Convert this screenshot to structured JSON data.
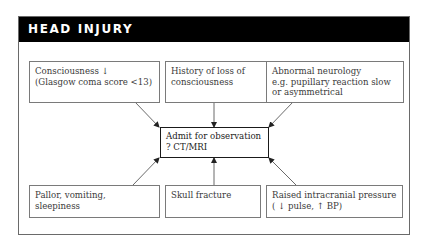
{
  "header": {
    "title": "HEAD INJURY"
  },
  "center": {
    "line1": "Admit for observation",
    "line2": "? CT/MRI"
  },
  "top_nodes": [
    {
      "line1": "Consciousness ↓",
      "line2": "(Glasgow coma score <13)",
      "line3": ""
    },
    {
      "line1": "History of loss of",
      "line2": "consciousness",
      "line3": ""
    },
    {
      "line1": "Abnormal neurology",
      "line2": "e.g. pupillary reaction slow",
      "line3": "or asymmetrical"
    }
  ],
  "bottom_nodes": [
    {
      "line1": "Pallor, vomiting,",
      "line2": "sleepiness"
    },
    {
      "line1": "Skull fracture",
      "line2": ""
    },
    {
      "line1": "Raised intracranial pressure",
      "line2": "( ↓ pulse, ↑ BP)"
    }
  ],
  "colors": {
    "header_bg": "#000000",
    "border": "#7a7a7a",
    "text": "#3a3a3a"
  }
}
